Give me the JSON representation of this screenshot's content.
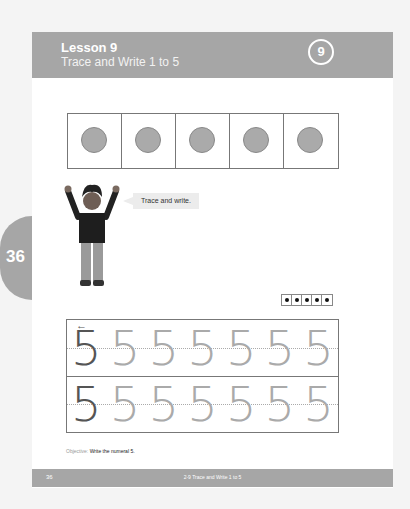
{
  "header": {
    "lesson": "Lesson 9",
    "title": "Trace and Write 1 to 5",
    "badge": "9"
  },
  "page_tab": "36",
  "ten_frame": {
    "cells": 5,
    "filled": 5
  },
  "speech_bubble": "Trace and write.",
  "dot_card": {
    "count": 5
  },
  "tracing": {
    "arrow": "←",
    "rows": [
      [
        "5",
        "5",
        "5",
        "5",
        "5",
        "5",
        "5"
      ],
      [
        "5",
        "5",
        "5",
        "5",
        "5",
        "5",
        "5"
      ]
    ]
  },
  "objective": {
    "label": "Objective:",
    "text": "Write the numeral 5."
  },
  "footer": {
    "page": "36",
    "title": "2-9 Trace and Write 1 to 5"
  },
  "colors": {
    "header_bg": "#a6a6a6",
    "counter": "#aaaaaa"
  }
}
